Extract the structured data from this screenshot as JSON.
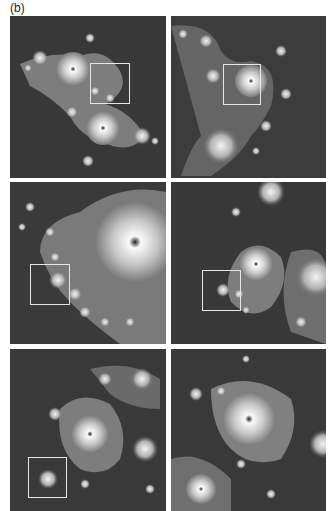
{
  "figure": {
    "label": "(b)",
    "panels": [
      {
        "id": "panel-1",
        "row": 1,
        "col": 1,
        "zoom_box": {
          "x": 80,
          "y": 47,
          "w": 40,
          "h": 41
        }
      },
      {
        "id": "panel-2",
        "row": 1,
        "col": 2,
        "zoom_box": {
          "x": 52,
          "y": 48,
          "w": 38,
          "h": 41
        }
      },
      {
        "id": "panel-3",
        "row": 2,
        "col": 1,
        "zoom_box": {
          "x": 20,
          "y": 82,
          "w": 40,
          "h": 41
        }
      },
      {
        "id": "panel-4",
        "row": 2,
        "col": 2,
        "zoom_box": {
          "x": 31,
          "y": 88,
          "w": 39,
          "h": 41
        }
      },
      {
        "id": "panel-5",
        "row": 3,
        "col": 1,
        "zoom_box": {
          "x": 18,
          "y": 108,
          "w": 39,
          "h": 41
        }
      },
      {
        "id": "panel-6",
        "row": 3,
        "col": 2,
        "zoom_box": null
      }
    ]
  },
  "colors": {
    "background": "#3a3a3a",
    "fractal_body": "#8a8a8a",
    "highlight": "#f2f2f2",
    "zoom_box": "#e6e6e6"
  }
}
